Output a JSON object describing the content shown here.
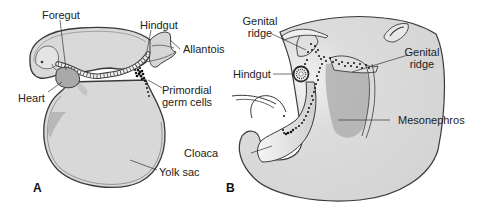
{
  "figure": {
    "panels": [
      {
        "id": "A",
        "label": "A",
        "labels": {
          "foregut": "Foregut",
          "hindgut": "Hindgut",
          "allantois": "Allantois",
          "heart": "Heart",
          "primordial_germ_cells_line1": "Primordial",
          "primordial_germ_cells_line2": "germ cells",
          "yolk_sac": "Yolk sac"
        }
      },
      {
        "id": "B",
        "label": "B",
        "labels": {
          "genital_ridge_left_line1": "Genital",
          "genital_ridge_left_line2": "ridge",
          "genital_ridge_right_line1": "Genital",
          "genital_ridge_right_line2": "ridge",
          "hindgut": "Hindgut",
          "cloaca": "Cloaca",
          "mesonephros": "Mesonephros"
        }
      }
    ],
    "colors": {
      "tissue_fill": "#d9d9d9",
      "tissue_dark": "#a8a8a8",
      "outline": "#3a3a3a",
      "germ_cells": "#111111",
      "label_text": "#222222"
    }
  }
}
